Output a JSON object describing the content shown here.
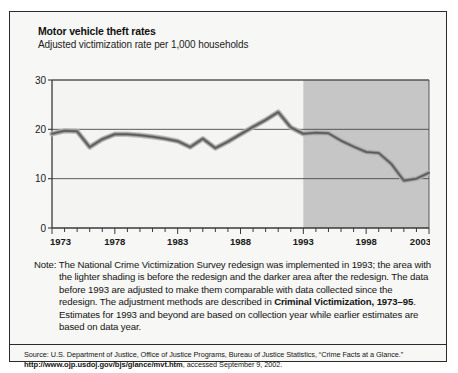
{
  "figure": {
    "title": "Motor vehicle theft rates",
    "subtitle": "Adjusted victimization rate per 1,000 households",
    "note_label": "Note:",
    "note_text_1": "The National Crime Victimization Survey redesign was implemented in 1993; the area with the lighter shading is before the redesign and the darker area after the redesign. The data before 1993 are adjusted to make them comparable with data collected since the redesign. The adjustment methods are described in ",
    "note_emphasis": "Criminal Victimization, 1973–95",
    "note_text_2": ". Estimates for 1993 and beyond are based on collection year while earlier estimates are based on data year.",
    "source_prefix": "Source: U.S. Department of Justice, Office of Justice Programs, Bureau of Justice Statistics, “Crime Facts at a Glance.”",
    "source_url": "http://www.ojp.usdoj.gov/bjs/glance/mvt.htm",
    "source_suffix": ", accessed September 9, 2002."
  },
  "colors": {
    "panel_background": "#f7f7f5",
    "plot_background_light": "#f4f4f2",
    "plot_background_shaded": "#c6c6c6",
    "line": "#6e6e6e",
    "line_highlight": "#9a9a9a",
    "axis": "#3a3a3a",
    "gridline": "#4a4a4a",
    "border": "#2b2b2b",
    "text": "#141414"
  },
  "chart_data": {
    "type": "line",
    "title": "Motor vehicle theft rates",
    "subtitle": "Adjusted victimization rate per 1,000 households",
    "xlabel": "",
    "ylabel": "Adjusted victimization rate per 1,000 households",
    "ylim": [
      0,
      30
    ],
    "xlim": [
      1973,
      2003
    ],
    "ytick_labels": [
      "0",
      "10",
      "20",
      "30"
    ],
    "yticks": [
      0,
      10,
      20,
      30
    ],
    "xtick_labels": [
      "1973",
      "1978",
      "1983",
      "1988",
      "1993",
      "1998",
      "2003"
    ],
    "xticks_major": [
      1973,
      1978,
      1983,
      1988,
      1993,
      1998,
      2003
    ],
    "xticks_minor_every": 1,
    "grid": "horizontal",
    "legend": "none",
    "shaded_region": {
      "label": "after the redesign",
      "x_start": 1993,
      "x_end": 2003,
      "color": "#c6c6c6"
    },
    "x": [
      1973,
      1974,
      1975,
      1976,
      1977,
      1978,
      1979,
      1980,
      1981,
      1982,
      1983,
      1984,
      1985,
      1986,
      1987,
      1988,
      1989,
      1990,
      1991,
      1992,
      1993,
      1994,
      1995,
      1996,
      1997,
      1998,
      1999,
      2000,
      2001,
      2002,
      2003
    ],
    "series": [
      {
        "name": "Motor vehicle theft rate",
        "values": [
          19.1,
          19.7,
          19.6,
          16.4,
          18.0,
          19.0,
          19.0,
          18.8,
          18.5,
          18.1,
          17.6,
          16.4,
          18.1,
          16.2,
          17.5,
          19.0,
          20.5,
          21.9,
          23.5,
          20.4,
          19.1,
          19.3,
          19.2,
          17.7,
          16.5,
          15.4,
          15.2,
          13.0,
          9.6,
          10.0,
          11.2
        ]
      }
    ]
  }
}
